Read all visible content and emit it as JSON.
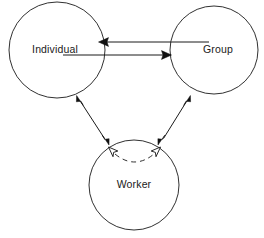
{
  "diagram": {
    "type": "venn-triad-relationship-diagram",
    "background_color": "#ffffff",
    "stroke_color": "#1a1a1a",
    "width": 264,
    "height": 238,
    "nodes": [
      {
        "id": "individual",
        "label": "Individual",
        "shape": "circle",
        "cx": 57,
        "cy": 50,
        "r": 48,
        "label_x": 55,
        "label_y": 50
      },
      {
        "id": "group",
        "label": "Group",
        "shape": "circle",
        "cx": 214,
        "cy": 50,
        "r": 44,
        "label_x": 218,
        "label_y": 50
      },
      {
        "id": "worker",
        "label": "Worker",
        "shape": "circle",
        "cx": 134,
        "cy": 185,
        "r": 45,
        "label_x": 134,
        "label_y": 185
      }
    ],
    "connectors": [
      {
        "id": "group-to-individual",
        "from": "group",
        "to": "individual",
        "style": "solid",
        "direction": "single",
        "head_style": "filled",
        "x1": 209,
        "y1": 42,
        "x2": 99,
        "y2": 42
      },
      {
        "id": "individual-to-group",
        "from": "individual",
        "to": "group",
        "style": "solid",
        "direction": "single",
        "head_style": "filled",
        "x1": 63,
        "y1": 55,
        "x2": 172,
        "y2": 55
      },
      {
        "id": "individual-worker",
        "from": "individual",
        "to": "worker",
        "style": "solid",
        "direction": "double",
        "head_style": "filled",
        "x1": 77,
        "y1": 96,
        "x2": 108,
        "y2": 144
      },
      {
        "id": "group-worker",
        "from": "group",
        "to": "worker",
        "style": "solid",
        "direction": "double",
        "head_style": "filled",
        "x1": 190,
        "y1": 96,
        "x2": 160,
        "y2": 144
      },
      {
        "id": "worker-internal-arc",
        "from": "worker",
        "to": "worker",
        "style": "dashed",
        "direction": "double",
        "head_style": "hollow",
        "arc_start_x": 110,
        "arc_start_y": 151,
        "arc_end_x": 159,
        "arc_end_y": 151,
        "arc_sag_y": 166
      }
    ]
  }
}
